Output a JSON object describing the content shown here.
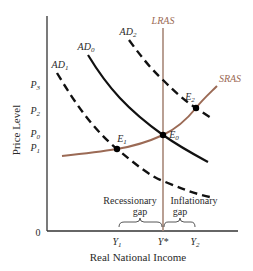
{
  "diagram": {
    "type": "AD-AS model",
    "axes": {
      "y_label": "Price Level",
      "x_label": "Real National Income",
      "origin_label": "0"
    },
    "y_ticks": [
      {
        "label": "P",
        "sub": "3",
        "y": 84
      },
      {
        "label": "P",
        "sub": "2",
        "y": 110
      },
      {
        "label": "P",
        "sub": "0",
        "y": 134
      },
      {
        "label": "P",
        "sub": "1",
        "y": 148
      }
    ],
    "x_ticks": [
      {
        "label": "Y",
        "sub": "1",
        "x": 117
      },
      {
        "label": "Y*",
        "sub": "",
        "x": 163
      },
      {
        "label": "Y",
        "sub": "2",
        "x": 193
      }
    ],
    "curves": {
      "lras": {
        "label": "LRAS",
        "style": "solid",
        "color": "#a88878"
      },
      "sras": {
        "label": "SRAS",
        "style": "solid",
        "color": "#9b6a55"
      },
      "ad0": {
        "label": "AD",
        "sub": "0",
        "style": "solid",
        "color": "#111111"
      },
      "ad1": {
        "label": "AD",
        "sub": "1",
        "style": "dashed",
        "color": "#111111"
      },
      "ad2": {
        "label": "AD",
        "sub": "2",
        "style": "dashed",
        "color": "#111111"
      }
    },
    "equilibria": [
      {
        "label": "E",
        "sub": "0",
        "x": 163,
        "y": 135
      },
      {
        "label": "E",
        "sub": "1",
        "x": 117,
        "y": 149
      },
      {
        "label": "E",
        "sub": "2",
        "x": 196,
        "y": 108
      }
    ],
    "gaps": {
      "recessionary": {
        "line1": "Recessionary",
        "line2": "gap"
      },
      "inflationary": {
        "line1": "Inflationary",
        "line2": "gap"
      }
    }
  }
}
